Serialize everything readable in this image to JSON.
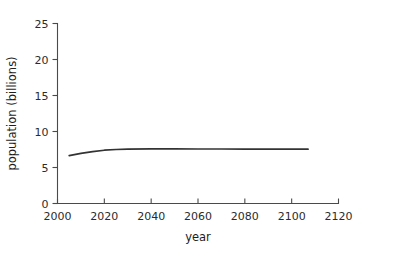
{
  "chart_data": {
    "type": "line",
    "title": "",
    "xlabel": "year",
    "ylabel": "population (billions)",
    "xlim": [
      2000,
      2120
    ],
    "ylim": [
      0,
      25
    ],
    "xticks": [
      2000,
      2020,
      2040,
      2060,
      2080,
      2100,
      2120
    ],
    "xtick_labels": [
      "2000",
      "2020",
      "2040",
      "2060",
      "2080",
      "2100",
      "2120"
    ],
    "yticks": [
      0,
      5,
      10,
      15,
      20,
      25
    ],
    "ytick_labels": [
      "0",
      "5",
      "10",
      "15",
      "20",
      "25"
    ],
    "grid": false,
    "legend": false,
    "line_color": "#333333",
    "series": [
      {
        "name": "world population projection",
        "x": [
          2005,
          2010,
          2015,
          2020,
          2025,
          2030,
          2040,
          2050,
          2060,
          2070,
          2080,
          2090,
          2100,
          2107
        ],
        "values": [
          6.65,
          6.95,
          7.2,
          7.4,
          7.5,
          7.55,
          7.58,
          7.58,
          7.57,
          7.57,
          7.56,
          7.56,
          7.55,
          7.55
        ]
      }
    ]
  },
  "axes": {
    "x_title": "year",
    "y_title": "population (billions)"
  }
}
